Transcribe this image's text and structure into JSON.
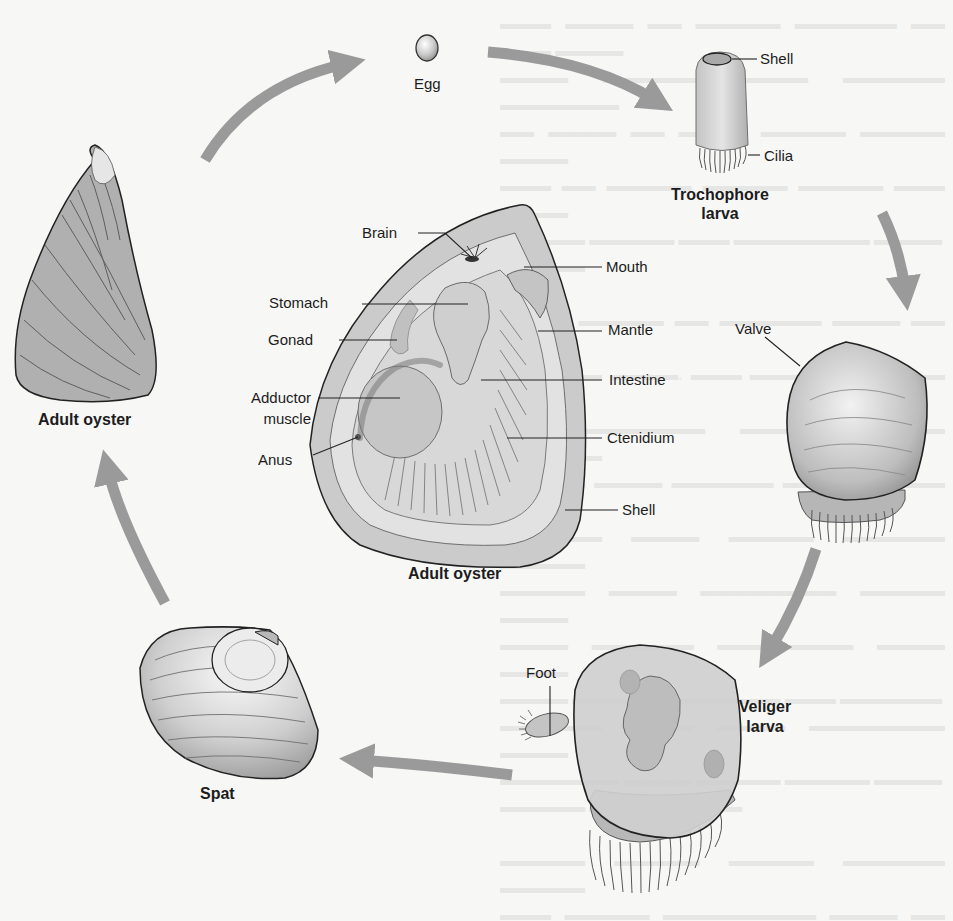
{
  "diagram": {
    "type": "life-cycle",
    "arrow_color": "#9a9a9a",
    "stages": [
      {
        "id": "adult-oyster-shell",
        "label": "Adult oyster"
      },
      {
        "id": "egg",
        "label": "Egg"
      },
      {
        "id": "trochophore",
        "label": "Trochophore\nlarva",
        "line1": "Trochophore",
        "line2": "larva",
        "parts": [
          "Shell",
          "Cilia"
        ]
      },
      {
        "id": "valve-stage",
        "parts": [
          "Valve"
        ]
      },
      {
        "id": "veliger",
        "label": "Veliger\nlarva",
        "line1": "Veliger",
        "line2": "larva",
        "parts": [
          "Foot"
        ]
      },
      {
        "id": "spat",
        "label": "Spat"
      }
    ],
    "anatomy": {
      "title": "Adult oyster",
      "left_labels": [
        "Brain",
        "Stomach",
        "Gonad",
        "Adductor",
        "muscle",
        "Anus"
      ],
      "right_labels": [
        "Mouth",
        "Mantle",
        "Intestine",
        "Ctenidium",
        "Shell"
      ]
    }
  },
  "labels": {
    "egg": "Egg",
    "troch_shell": "Shell",
    "troch_cilia": "Cilia",
    "troch_1": "Trochophore",
    "troch_2": "larva",
    "valve": "Valve",
    "foot": "Foot",
    "veliger_1": "Veliger",
    "veliger_2": "larva",
    "spat": "Spat",
    "adult_left": "Adult oyster",
    "adult_center": "Adult oyster",
    "brain": "Brain",
    "mouth": "Mouth",
    "stomach": "Stomach",
    "mantle": "Mantle",
    "gonad": "Gonad",
    "intestine": "Intestine",
    "adductor_1": "Adductor",
    "adductor_2": "muscle",
    "ctenidium": "Ctenidium",
    "anus": "Anus",
    "shell": "Shell"
  }
}
